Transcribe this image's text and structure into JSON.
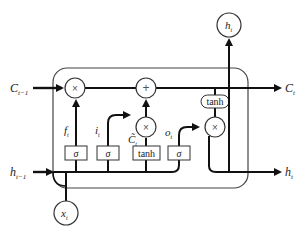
{
  "diagram": {
    "type": "LSTM cell",
    "inputs": {
      "cell_state_prev": {
        "label": "C",
        "sub": "t−1"
      },
      "hidden_prev": {
        "label": "h",
        "sub": "t−1"
      },
      "input": {
        "label": "x",
        "sub": "t"
      }
    },
    "outputs": {
      "cell_state": {
        "label": "C",
        "sub": "t"
      },
      "hidden_out_right": {
        "label": "h",
        "sub": "t"
      },
      "hidden_out_top": {
        "label": "h",
        "sub": "t"
      }
    },
    "gates": {
      "forget": {
        "label": "f",
        "sub": "t",
        "activation": "σ"
      },
      "input": {
        "label": "i",
        "sub": "t",
        "activation": "σ"
      },
      "candidate": {
        "label": "C̃",
        "sub": "t",
        "activation": "tanh"
      },
      "output": {
        "label": "o",
        "sub": "t",
        "activation": "σ"
      }
    },
    "operators": {
      "multiply": "×",
      "add": "+",
      "tanh": "tanh"
    }
  }
}
